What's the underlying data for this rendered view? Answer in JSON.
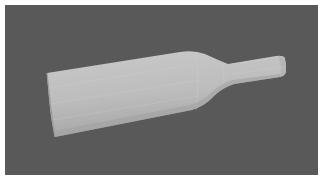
{
  "figure": {
    "colors": {
      "page_background": "#ffffff",
      "panel_background": "#595959",
      "bottle_light": "#c4c4c4",
      "bottle_mid": "#b0b0b0",
      "bottle_shadow": "#9a9a9a"
    }
  }
}
